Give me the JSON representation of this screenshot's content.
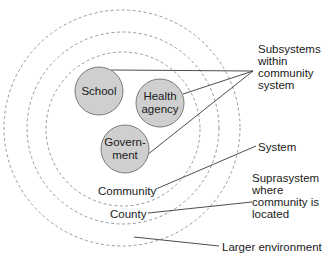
{
  "diagram": {
    "type": "concentric-systems-diagram",
    "colors": {
      "dashed_ring": "#9a9a9a",
      "subsystem_fill": "#cfcfcf",
      "subsystem_stroke": "#7a7a7a",
      "leader_line": "#3a3a3a",
      "text": "#1a1a1a"
    },
    "rings": [
      {
        "id": "community",
        "label": "Community"
      },
      {
        "id": "county",
        "label": "County"
      },
      {
        "id": "larger-environment",
        "label": ""
      }
    ],
    "subsystems": [
      {
        "id": "school",
        "lines": [
          "School"
        ]
      },
      {
        "id": "health-agency",
        "lines": [
          "Health",
          "agency"
        ]
      },
      {
        "id": "government",
        "lines": [
          "Govern-",
          "ment"
        ]
      }
    ],
    "annotations": {
      "subsystems": [
        "Subsystems",
        "within",
        "community",
        "system"
      ],
      "system": "System",
      "suprasystem": [
        "Suprasystem",
        "where",
        "community is",
        "located"
      ],
      "larger_environment": "Larger environment"
    }
  }
}
